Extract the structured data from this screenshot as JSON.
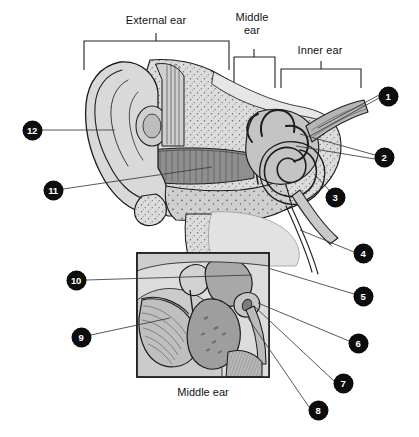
{
  "figure": {
    "background_color": "#ffffff",
    "line_color": "#2a2a2a",
    "marker_fill": "#0d0d0d",
    "marker_text_color": "#ffffff"
  },
  "region_labels": [
    {
      "id": "external-ear",
      "text": "External ear"
    },
    {
      "id": "middle-ear",
      "text": "Middle\near"
    },
    {
      "id": "inner-ear",
      "text": "Inner ear"
    }
  ],
  "inset": {
    "caption": "Middle ear"
  },
  "markers": [
    {
      "number": "1",
      "x": 388,
      "y": 96,
      "side": "right"
    },
    {
      "number": "2",
      "x": 384,
      "y": 157,
      "side": "right"
    },
    {
      "number": "3",
      "x": 335,
      "y": 197,
      "side": "right"
    },
    {
      "number": "4",
      "x": 363,
      "y": 253,
      "side": "right"
    },
    {
      "number": "5",
      "x": 363,
      "y": 296,
      "side": "right"
    },
    {
      "number": "6",
      "x": 358,
      "y": 343,
      "side": "right"
    },
    {
      "number": "7",
      "x": 343,
      "y": 383,
      "side": "right"
    },
    {
      "number": "8",
      "x": 318,
      "y": 410,
      "side": "right"
    },
    {
      "number": "9",
      "x": 81,
      "y": 337,
      "side": "left"
    },
    {
      "number": "10",
      "x": 76,
      "y": 280,
      "side": "left"
    },
    {
      "number": "11",
      "x": 53,
      "y": 190,
      "side": "left"
    },
    {
      "number": "12",
      "x": 32,
      "y": 130,
      "side": "left"
    }
  ]
}
